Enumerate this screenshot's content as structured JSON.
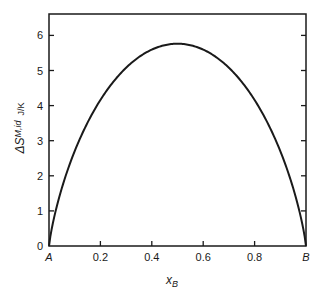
{
  "chart_data": {
    "type": "line",
    "title": "",
    "xlabel": "x_B",
    "ylabel": "ΔS_M,id  J/K",
    "xlim": [
      0,
      1
    ],
    "ylim": [
      0,
      6.5
    ],
    "grid": false,
    "legend": null,
    "x_ticks": [
      {
        "value": 0,
        "label": "A"
      },
      {
        "value": 0.2,
        "label": "0.2"
      },
      {
        "value": 0.4,
        "label": "0.4"
      },
      {
        "value": 0.6,
        "label": "0.6"
      },
      {
        "value": 0.8,
        "label": "0.8"
      },
      {
        "value": 1,
        "label": "B"
      }
    ],
    "y_ticks": [
      {
        "value": 0,
        "label": "0"
      },
      {
        "value": 1,
        "label": "1"
      },
      {
        "value": 2,
        "label": "2"
      },
      {
        "value": 3,
        "label": "3"
      },
      {
        "value": 4,
        "label": "4"
      },
      {
        "value": 5,
        "label": "5"
      },
      {
        "value": 6,
        "label": "6"
      }
    ],
    "series": [
      {
        "name": "ideal entropy of mixing",
        "x": [
          0,
          0.05,
          0.1,
          0.15,
          0.2,
          0.25,
          0.3,
          0.35,
          0.4,
          0.45,
          0.5,
          0.55,
          0.6,
          0.65,
          0.7,
          0.75,
          0.8,
          0.85,
          0.9,
          0.95,
          1
        ],
        "values": [
          0,
          1.65,
          2.7,
          3.52,
          4.16,
          4.68,
          5.08,
          5.39,
          5.6,
          5.72,
          5.76,
          5.72,
          5.6,
          5.39,
          5.08,
          4.68,
          4.16,
          3.52,
          2.7,
          1.65,
          0
        ]
      }
    ]
  },
  "labels": {
    "x_main": "x",
    "x_sub": "B",
    "y_main": "ΔS",
    "y_sub": "M,id",
    "y_unit": "J/K"
  }
}
